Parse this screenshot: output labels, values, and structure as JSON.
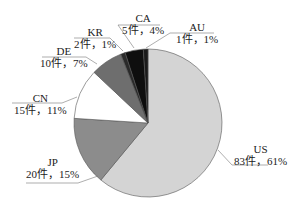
{
  "chart_data": {
    "type": "pie",
    "title": "",
    "start_angle": "12 o'clock, clockwise",
    "slices": [
      {
        "name": "US",
        "count": 83,
        "count_label": "83件",
        "percent": 61,
        "label": "83件，61%",
        "color": "#d4d4d4"
      },
      {
        "name": "JP",
        "count": 20,
        "count_label": "20件",
        "percent": 15,
        "label": "20件，15%",
        "color": "#8c8c8c"
      },
      {
        "name": "CN",
        "count": 15,
        "count_label": "15件",
        "percent": 11,
        "label": "15件，11%",
        "color": "#ffffff"
      },
      {
        "name": "DE",
        "count": 10,
        "count_label": "10件",
        "percent": 7,
        "label": "10件，7%",
        "color": "#6e6e6e"
      },
      {
        "name": "KR",
        "count": 2,
        "count_label": "2件",
        "percent": 1,
        "label": "2件，1%",
        "color": "#2a2a2a"
      },
      {
        "name": "CA",
        "count": 5,
        "count_label": "5件",
        "percent": 4,
        "label": "5件，4%",
        "color": "#0e0e0e"
      },
      {
        "name": "AU",
        "count": 1,
        "count_label": "1件",
        "percent": 1,
        "label": "1件，1%",
        "color": "#1a1a1a"
      }
    ]
  },
  "labels": {
    "US": {
      "name": "US",
      "value": "83件，61%"
    },
    "JP": {
      "name": "JP",
      "value": "20件，15%"
    },
    "CN": {
      "name": "CN",
      "value": "15件，11%"
    },
    "DE": {
      "name": "DE",
      "value": "10件，7%"
    },
    "KR": {
      "name": "KR",
      "value": "2件，1%"
    },
    "CA": {
      "name": "CA",
      "value": "5件，4%"
    },
    "AU": {
      "name": "AU",
      "value": "1件，1%"
    }
  }
}
